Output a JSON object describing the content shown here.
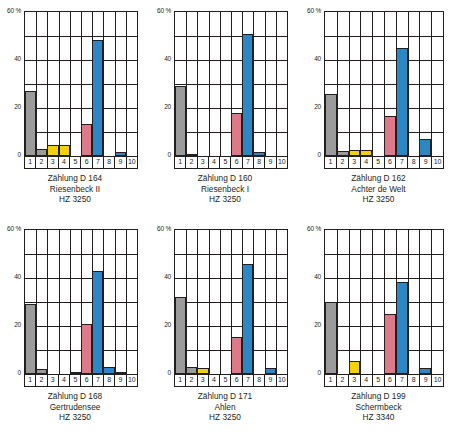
{
  "figure": {
    "panel_count": 6,
    "axis": {
      "y_unit": "60 %",
      "y_ticks": [
        "60 %",
        "40",
        "20",
        "0"
      ],
      "y_tick_values": [
        60,
        40,
        20,
        0
      ],
      "ylim": [
        0,
        60
      ],
      "x_categories": [
        "1",
        "2",
        "3",
        "4",
        "5",
        "6",
        "7",
        "8",
        "9",
        "10"
      ]
    },
    "colors": {
      "gray": "#9b9b9b",
      "yellow": "#f5d10c",
      "pink": "#dd7a8a",
      "blue": "#2d87c4",
      "outline": "#231f20",
      "background": "#ffffff"
    }
  },
  "chart_data": [
    {
      "type": "bar",
      "title": "Zählung D 164",
      "subtitle": "Riesenbeck II",
      "code": "HZ 3250",
      "xlabel": "",
      "ylabel": "60 %",
      "ylim": [
        0,
        60
      ],
      "categories": [
        "1",
        "2",
        "3",
        "4",
        "5",
        "6",
        "7",
        "8",
        "9",
        "10"
      ],
      "values": [
        27,
        3,
        4.5,
        4.5,
        0,
        13.5,
        48.5,
        0,
        1.5,
        0
      ],
      "colors": [
        "gray",
        "gray",
        "yellow",
        "yellow",
        "none",
        "pink",
        "blue",
        "none",
        "blue",
        "none"
      ]
    },
    {
      "type": "bar",
      "title": "Zählung D 160",
      "subtitle": "Riesenbeck I",
      "code": "HZ 3250",
      "xlabel": "",
      "ylabel": "60 %",
      "ylim": [
        0,
        60
      ],
      "categories": [
        "1",
        "2",
        "3",
        "4",
        "5",
        "6",
        "7",
        "8",
        "9",
        "10"
      ],
      "values": [
        29,
        1,
        0,
        0,
        0,
        18,
        51,
        1.5,
        0,
        0
      ],
      "colors": [
        "gray",
        "gray",
        "none",
        "none",
        "none",
        "pink",
        "blue",
        "blue",
        "none",
        "none"
      ]
    },
    {
      "type": "bar",
      "title": "Zählung D 162",
      "subtitle": "Achter de Welt",
      "code": "HZ 3250",
      "xlabel": "",
      "ylabel": "60 %",
      "ylim": [
        0,
        60
      ],
      "categories": [
        "1",
        "2",
        "3",
        "4",
        "5",
        "6",
        "7",
        "8",
        "9",
        "10"
      ],
      "values": [
        26,
        2,
        2.5,
        2.5,
        0,
        16.5,
        45,
        0,
        7,
        0
      ],
      "colors": [
        "gray",
        "gray",
        "yellow",
        "yellow",
        "none",
        "pink",
        "blue",
        "none",
        "blue",
        "none"
      ]
    },
    {
      "type": "bar",
      "title": "Zählung D 168",
      "subtitle": "Gertrudensee",
      "code": "HZ 3250",
      "xlabel": "",
      "ylabel": "60 %",
      "ylim": [
        0,
        60
      ],
      "categories": [
        "1",
        "2",
        "3",
        "4",
        "5",
        "6",
        "7",
        "8",
        "9",
        "10"
      ],
      "values": [
        29,
        2,
        0,
        0,
        1,
        21,
        43,
        3,
        1,
        0
      ],
      "colors": [
        "gray",
        "gray",
        "none",
        "none",
        "yellow",
        "pink",
        "blue",
        "blue",
        "blue",
        "none"
      ]
    },
    {
      "type": "bar",
      "title": "Zählung D 171",
      "subtitle": "Ahlen",
      "code": "HZ 3250",
      "xlabel": "",
      "ylabel": "60 %",
      "ylim": [
        0,
        60
      ],
      "categories": [
        "1",
        "2",
        "3",
        "4",
        "5",
        "6",
        "7",
        "8",
        "9",
        "10"
      ],
      "values": [
        32,
        3,
        2.5,
        0,
        0,
        15.5,
        46,
        0,
        2.5,
        0
      ],
      "colors": [
        "gray",
        "gray",
        "yellow",
        "none",
        "none",
        "pink",
        "blue",
        "none",
        "blue",
        "none"
      ]
    },
    {
      "type": "bar",
      "title": "Zählung D 199",
      "subtitle": "Schermbeck",
      "code": "HZ 3340",
      "xlabel": "",
      "ylabel": "60 %",
      "ylim": [
        0,
        60
      ],
      "categories": [
        "1",
        "2",
        "3",
        "4",
        "5",
        "6",
        "7",
        "8",
        "9",
        "10"
      ],
      "values": [
        30,
        0,
        5.5,
        0,
        0,
        25,
        38.5,
        0,
        2.5,
        0
      ],
      "colors": [
        "gray",
        "none",
        "yellow",
        "none",
        "none",
        "pink",
        "blue",
        "none",
        "blue",
        "none"
      ]
    }
  ]
}
